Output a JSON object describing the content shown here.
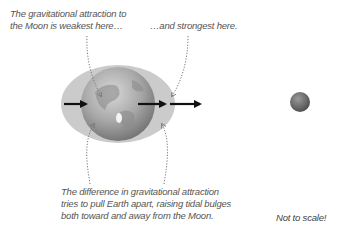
{
  "labels": {
    "weakest": [
      "The gravitational attraction to",
      "the Moon is weakest here…"
    ],
    "strongest": "…and strongest here.",
    "difference": [
      "The difference in gravitational attraction",
      "tries to pull Earth apart, raising tidal bulges",
      "both toward and away from the Moon."
    ],
    "scale_note": "Not to scale!"
  },
  "objects": {
    "earth": {
      "name": "Earth"
    },
    "moon": {
      "name": "Moon"
    },
    "tidal_bulge": {
      "name": "tidal bulge"
    }
  },
  "arrows": [
    {
      "id": "far-side-force",
      "meaning": "weakest pull"
    },
    {
      "id": "center-force",
      "meaning": "average pull"
    },
    {
      "id": "near-side-force",
      "meaning": "strongest pull"
    }
  ],
  "colors": {
    "bulge": "#c9c9c9",
    "earth_light": "#bdbdbd",
    "earth_dark": "#6e6e6e",
    "moon": "#6a6a6a",
    "arrow": "#111111",
    "text": "#555555",
    "leader": "#777777"
  }
}
